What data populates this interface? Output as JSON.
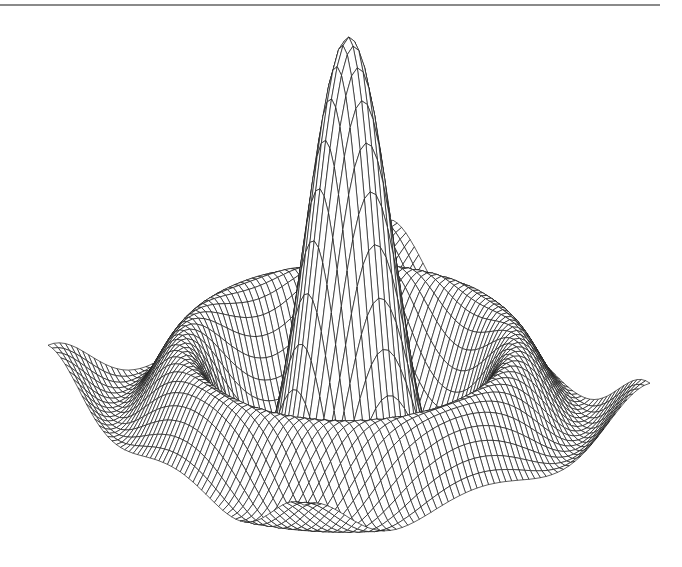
{
  "figure": {
    "top_rule_color": "#8a8a8a",
    "line_color": "#1a1a1a",
    "background": "#ffffff"
  },
  "chart_data": {
    "type": "surface_wireframe",
    "title": "",
    "xlabel": "",
    "ylabel": "",
    "zlabel": "",
    "function": "z = sin(r)/r (sinc-like radial function)",
    "grid_resolution": 60,
    "domain": {
      "x": [
        -8,
        8
      ],
      "y": [
        -8,
        8
      ]
    },
    "z_range": [
      -0.22,
      1.0
    ],
    "features": {
      "central_peak": "single tall narrow peak at origin, z=1",
      "ripples": "circular trough then secondary ring of low humps (~0.13)",
      "base": "flat plane at z=0 near edges"
    },
    "projection": {
      "left_corner": [
        48,
        370
      ],
      "back_corner": [
        393,
        245
      ],
      "right_corner": [
        650,
        408
      ],
      "front_corner": [
        304,
        530
      ],
      "peak_apex": [
        350,
        37
      ]
    },
    "axes_visible": false,
    "grid": false,
    "legend": null
  }
}
